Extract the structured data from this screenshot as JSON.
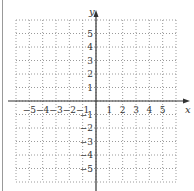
{
  "figure": {
    "title_fragment": "Graph",
    "x_axis": {
      "label": "x",
      "min": -6,
      "max": 6,
      "ticks": [
        -5,
        -4,
        -3,
        -2,
        -1,
        1,
        2,
        3,
        4,
        5
      ],
      "tick_labels": [
        "−5",
        "−4",
        "−3",
        "−2",
        "−1",
        "1",
        "2",
        "3",
        "4",
        "5"
      ]
    },
    "y_axis": {
      "label": "y",
      "min": -6,
      "max": 6,
      "ticks": [
        5,
        4,
        3,
        2,
        1,
        -1,
        -2,
        -3,
        -4,
        -5
      ],
      "tick_labels": [
        "5",
        "4",
        "3",
        "2",
        "1",
        "−1",
        "−2",
        "−3",
        "−4",
        "−5"
      ]
    },
    "grid": "dotted",
    "grid_color": "#9a9a9a",
    "axis_color": "#333333"
  }
}
